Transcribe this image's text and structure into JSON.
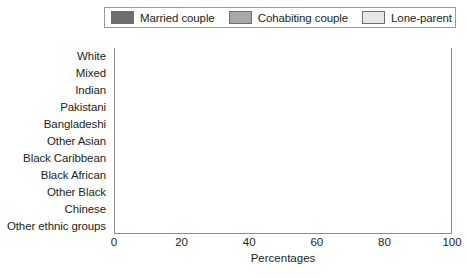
{
  "chart_data": {
    "type": "bar",
    "orientation": "horizontal",
    "stacked": true,
    "stacked_percent": true,
    "title": "",
    "subtitle": "",
    "xlabel": "Percentages",
    "ylabel": "",
    "xlim": [
      0,
      100
    ],
    "xticks": [
      0,
      20,
      40,
      60,
      80,
      100
    ],
    "grid": true,
    "grid_axis": "x",
    "legend_position": "top",
    "categories": [
      "White",
      "Mixed",
      "Indian",
      "Pakistani",
      "Bangladeshi",
      "Other Asian",
      "Black Caribbean",
      "Black African",
      "Other Black",
      "Chinese",
      "Other ethnic groups"
    ],
    "series": [
      {
        "name": "Married couple",
        "color": "#6e6e6e",
        "values": [
          62,
          41,
          84,
          77,
          77,
          79,
          30,
          43,
          26,
          78,
          73
        ]
      },
      {
        "name": "Cohabiting couple",
        "color": "#a8a8a8",
        "values": [
          12,
          13,
          2,
          3,
          3,
          2,
          12,
          8,
          10,
          3,
          4
        ]
      },
      {
        "name": "Lone-parent",
        "color": "#e6e6e6",
        "values": [
          26,
          46,
          14,
          20,
          20,
          19,
          58,
          49,
          64,
          19,
          23
        ]
      }
    ]
  },
  "legend": {
    "items": [
      {
        "label": "Married couple",
        "color": "#6e6e6e"
      },
      {
        "label": "Cohabiting couple",
        "color": "#a8a8a8"
      },
      {
        "label": "Lone-parent",
        "color": "#e6e6e6"
      }
    ]
  }
}
